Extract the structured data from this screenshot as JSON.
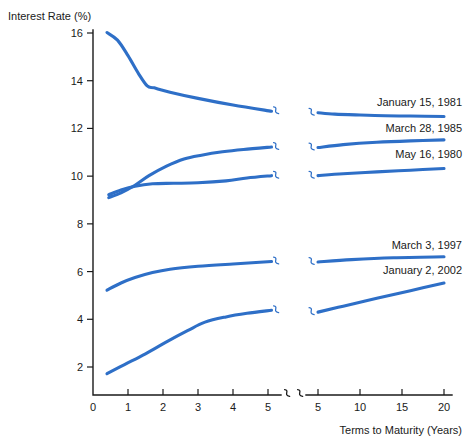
{
  "chart_data": {
    "type": "line",
    "title": "",
    "ylabel": "Interest Rate (%)",
    "xlabel": "Terms to Maturity (Years)",
    "ylim": [
      0,
      16.8
    ],
    "ytick_labels": [
      "2",
      "4",
      "6",
      "8",
      "10",
      "12",
      "14",
      "16"
    ],
    "ytick_values": [
      2,
      4,
      6,
      8,
      10,
      12,
      14,
      16
    ],
    "xtick_labels_left": [
      "0",
      "1",
      "2",
      "3",
      "4",
      "5"
    ],
    "xtick_values_left": [
      0,
      1,
      2,
      3,
      4,
      5
    ],
    "xtick_labels_right": [
      "5",
      "10",
      "15",
      "20"
    ],
    "xtick_values_right": [
      5,
      10,
      15,
      20
    ],
    "grid": false,
    "axis_break": true,
    "legend_position": "right-inline",
    "line_color": "#2E6FC7",
    "series": [
      {
        "name": "January 15, 1981",
        "label": "January 15, 1981",
        "label_x": 20,
        "label_y": 12.95,
        "left_points": [
          [
            0.4,
            16.02
          ],
          [
            0.7,
            15.7
          ],
          [
            1.0,
            15.05
          ],
          [
            1.3,
            14.3
          ],
          [
            1.55,
            13.78
          ],
          [
            1.75,
            13.7
          ],
          [
            2.2,
            13.52
          ],
          [
            3.0,
            13.26
          ],
          [
            4.0,
            12.98
          ],
          [
            5.1,
            12.72
          ]
        ],
        "right_points": [
          [
            5.0,
            12.66
          ],
          [
            7.0,
            12.6
          ],
          [
            10.0,
            12.56
          ],
          [
            13.0,
            12.53
          ],
          [
            16.0,
            12.52
          ],
          [
            20.0,
            12.5
          ]
        ]
      },
      {
        "name": "March 28, 1985",
        "label": "March 28, 1985",
        "label_x": 20,
        "label_y": 11.85,
        "left_points": [
          [
            0.45,
            9.1
          ],
          [
            0.8,
            9.3
          ],
          [
            1.2,
            9.62
          ],
          [
            1.6,
            10.02
          ],
          [
            2.1,
            10.42
          ],
          [
            2.6,
            10.72
          ],
          [
            3.1,
            10.88
          ],
          [
            3.7,
            11.02
          ],
          [
            4.3,
            11.12
          ],
          [
            5.1,
            11.22
          ]
        ],
        "right_points": [
          [
            5.0,
            11.2
          ],
          [
            8.0,
            11.32
          ],
          [
            12.0,
            11.42
          ],
          [
            16.0,
            11.48
          ],
          [
            20.0,
            11.52
          ]
        ]
      },
      {
        "name": "May 16, 1980",
        "label": "May 16, 1980",
        "label_x": 20,
        "label_y": 10.75,
        "left_points": [
          [
            0.45,
            9.22
          ],
          [
            0.8,
            9.42
          ],
          [
            1.2,
            9.58
          ],
          [
            1.7,
            9.68
          ],
          [
            2.3,
            9.7
          ],
          [
            3.0,
            9.72
          ],
          [
            3.8,
            9.8
          ],
          [
            4.4,
            9.92
          ],
          [
            5.1,
            10.02
          ]
        ],
        "right_points": [
          [
            5.0,
            10.02
          ],
          [
            8.0,
            10.1
          ],
          [
            12.0,
            10.18
          ],
          [
            16.0,
            10.25
          ],
          [
            20.0,
            10.32
          ]
        ]
      },
      {
        "name": "March 3, 1997",
        "label": "March 3, 1997",
        "label_x": 20,
        "label_y": 6.95,
        "left_points": [
          [
            0.4,
            5.22
          ],
          [
            0.8,
            5.52
          ],
          [
            1.2,
            5.75
          ],
          [
            1.7,
            5.96
          ],
          [
            2.2,
            6.1
          ],
          [
            3.0,
            6.22
          ],
          [
            4.0,
            6.32
          ],
          [
            5.1,
            6.42
          ]
        ],
        "right_points": [
          [
            5.0,
            6.4
          ],
          [
            9.0,
            6.5
          ],
          [
            14.0,
            6.58
          ],
          [
            20.0,
            6.62
          ]
        ]
      },
      {
        "name": "January 2, 2002",
        "label": "January 2, 2002",
        "label_x": 20,
        "label_y": 5.9,
        "left_points": [
          [
            0.4,
            1.72
          ],
          [
            0.9,
            2.1
          ],
          [
            1.5,
            2.55
          ],
          [
            2.1,
            3.05
          ],
          [
            2.7,
            3.52
          ],
          [
            3.2,
            3.88
          ],
          [
            3.8,
            4.1
          ],
          [
            4.4,
            4.25
          ],
          [
            5.1,
            4.38
          ]
        ],
        "right_points": [
          [
            5.0,
            4.3
          ],
          [
            8.0,
            4.55
          ],
          [
            12.0,
            4.88
          ],
          [
            16.0,
            5.2
          ],
          [
            20.0,
            5.52
          ]
        ]
      }
    ]
  }
}
